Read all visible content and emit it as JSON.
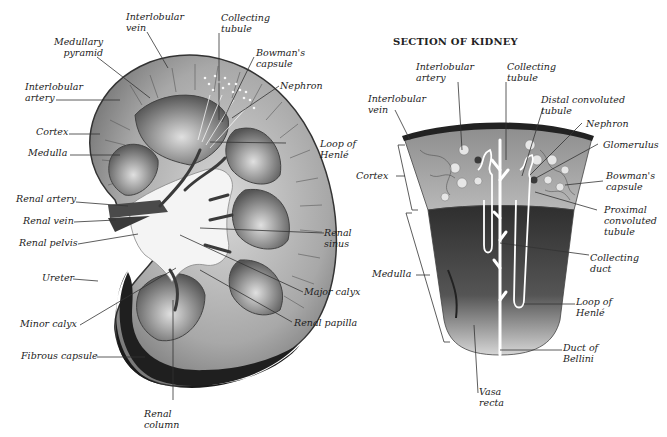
{
  "left_diagram": {
    "labels": {
      "interlobular_vein": [
        "Interlobular",
        "vein"
      ],
      "medullary_pyramid": [
        "Medullary",
        "pyramid"
      ],
      "interlobular_artery": [
        "Interlobular",
        "artery"
      ],
      "cortex": "Cortex",
      "medulla": "Medulla",
      "renal_artery": "Renal artery",
      "renal_vein": "Renal vein",
      "renal_pelvis": "Renal pelvis",
      "ureter": "Ureter",
      "minor_calyx": "Minor calyx",
      "fibrous_capsule": "Fibrous capsule",
      "renal_column": [
        "Renal",
        "column"
      ],
      "collecting_tubule": [
        "Collecting",
        "tubule"
      ],
      "bowmans_capsule": [
        "Bowman's",
        "capsule"
      ],
      "nephron": "Nephron",
      "loop_of_henle": [
        "Loop of",
        "Henlé"
      ],
      "renal_sinus": [
        "Renal",
        "sinus"
      ],
      "major_calyx": "Major calyx",
      "renal_papilla": "Renal papilla"
    }
  },
  "right_diagram": {
    "title": "SECTION OF KIDNEY",
    "labels": {
      "interlobular_artery": [
        "Interlobular",
        "artery"
      ],
      "collecting_tubule": [
        "Collecting",
        "tubule"
      ],
      "interlobular_vein": [
        "Interlobular",
        "vein"
      ],
      "distal_convoluted_tubule": [
        "Distal convoluted",
        "tubule"
      ],
      "nephron": "Nephron",
      "glomerulus": "Glomerulus",
      "cortex": "Cortex",
      "bowmans_capsule": [
        "Bowman's",
        "capsule"
      ],
      "proximal_convoluted_tubule": [
        "Proximal",
        "convoluted",
        "tubule"
      ],
      "collecting_duct": [
        "Collecting",
        "duct"
      ],
      "medulla": "Medulla",
      "loop_of_henle": [
        "Loop of",
        "Henlé"
      ],
      "duct_of_bellini": [
        "Duct of",
        "Bellini"
      ],
      "vasa_recta": [
        "Vasa",
        "recta"
      ]
    }
  },
  "colors": {
    "capsule_dark": "#1a1a1a",
    "cortex_gray": "#9a9a9a",
    "medulla_gray": "#6e6e6e",
    "pelvis_light": "#f2f2f2",
    "vessel": "#3a3a3a"
  }
}
